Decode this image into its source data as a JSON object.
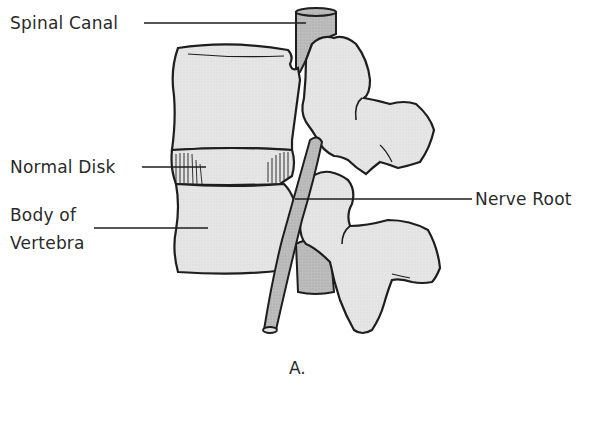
{
  "figure": {
    "caption": "A."
  },
  "labels": {
    "spinal_canal": "Spinal Canal",
    "normal_disk": "Normal Disk",
    "body_of_vertebra_line1": "Body of",
    "body_of_vertebra_line2": "Vertebra",
    "nerve_root": "Nerve Root"
  },
  "colors": {
    "background": "#ffffff",
    "bone_fill": "#e3e3e3",
    "canal_fill": "#b9b9b9",
    "nerve_fill": "#bdbdbd",
    "outline": "#1e1e1e",
    "label_text": "#2a2a2a"
  }
}
